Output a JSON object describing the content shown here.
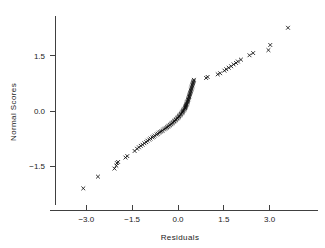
{
  "chart_data": {
    "type": "scatter",
    "title": "",
    "subtitle": "",
    "xlabel": "Residuals",
    "ylabel": "Normal Scores",
    "xlim": [
      -4.0,
      4.4
    ],
    "ylim": [
      -2.6,
      2.7
    ],
    "xticks": [
      -3.0,
      -1.5,
      0.0,
      1.5,
      3.0
    ],
    "xticklabels": [
      "−3.0",
      "−1.5",
      "0.0",
      "1.5",
      "3.0"
    ],
    "yticks": [
      -1.5,
      0.0,
      1.5
    ],
    "yticklabels": [
      "−1.5",
      "0.0",
      "1.5"
    ],
    "grid": false,
    "legend": null,
    "marker": "x",
    "marker_color": "#111111",
    "series": [
      {
        "name": "Residuals vs Normal Scores",
        "points": [
          [
            -3.1,
            -2.11
          ],
          [
            -2.62,
            -1.79
          ],
          [
            -2.08,
            -1.57
          ],
          [
            -2.02,
            -1.49
          ],
          [
            -2.0,
            -1.42
          ],
          [
            -1.96,
            -1.39
          ],
          [
            -1.72,
            -1.27
          ],
          [
            -1.66,
            -1.23
          ],
          [
            -1.42,
            -1.09
          ],
          [
            -1.34,
            -1.03
          ],
          [
            -1.28,
            -0.99
          ],
          [
            -1.22,
            -0.95
          ],
          [
            -1.16,
            -0.92
          ],
          [
            -1.1,
            -0.88
          ],
          [
            -1.04,
            -0.85
          ],
          [
            -1.0,
            -0.81
          ],
          [
            -0.94,
            -0.78
          ],
          [
            -0.9,
            -0.75
          ],
          [
            -0.84,
            -0.72
          ],
          [
            -0.8,
            -0.7
          ],
          [
            -0.76,
            -0.67
          ],
          [
            -0.7,
            -0.64
          ],
          [
            -0.66,
            -0.62
          ],
          [
            -0.62,
            -0.59
          ],
          [
            -0.58,
            -0.57
          ],
          [
            -0.54,
            -0.55
          ],
          [
            -0.5,
            -0.53
          ],
          [
            -0.46,
            -0.5
          ],
          [
            -0.42,
            -0.48
          ],
          [
            -0.38,
            -0.46
          ],
          [
            -0.35,
            -0.44
          ],
          [
            -0.32,
            -0.42
          ],
          [
            -0.29,
            -0.4
          ],
          [
            -0.26,
            -0.38
          ],
          [
            -0.23,
            -0.36
          ],
          [
            -0.2,
            -0.34
          ],
          [
            -0.18,
            -0.32
          ],
          [
            -0.15,
            -0.3
          ],
          [
            -0.12,
            -0.28
          ],
          [
            -0.1,
            -0.26
          ],
          [
            -0.07,
            -0.24
          ],
          [
            -0.05,
            -0.22
          ],
          [
            -0.02,
            -0.2
          ],
          [
            0.0,
            -0.18
          ],
          [
            0.02,
            -0.16
          ],
          [
            0.04,
            -0.14
          ],
          [
            0.06,
            -0.12
          ],
          [
            0.08,
            -0.1
          ],
          [
            0.1,
            -0.08
          ],
          [
            0.12,
            -0.06
          ],
          [
            0.14,
            -0.04
          ],
          [
            0.15,
            -0.02
          ],
          [
            0.17,
            0.0
          ],
          [
            0.18,
            0.02
          ],
          [
            0.2,
            0.04
          ],
          [
            0.21,
            0.06
          ],
          [
            0.23,
            0.08
          ],
          [
            0.24,
            0.1
          ],
          [
            0.25,
            0.12
          ],
          [
            0.26,
            0.14
          ],
          [
            0.27,
            0.16
          ],
          [
            0.28,
            0.18
          ],
          [
            0.29,
            0.2
          ],
          [
            0.3,
            0.23
          ],
          [
            0.31,
            0.25
          ],
          [
            0.32,
            0.27
          ],
          [
            0.33,
            0.3
          ],
          [
            0.34,
            0.32
          ],
          [
            0.35,
            0.35
          ],
          [
            0.36,
            0.38
          ],
          [
            0.37,
            0.4
          ],
          [
            0.38,
            0.43
          ],
          [
            0.39,
            0.46
          ],
          [
            0.4,
            0.49
          ],
          [
            0.41,
            0.52
          ],
          [
            0.42,
            0.55
          ],
          [
            0.43,
            0.58
          ],
          [
            0.44,
            0.61
          ],
          [
            0.45,
            0.64
          ],
          [
            0.46,
            0.67
          ],
          [
            0.47,
            0.7
          ],
          [
            0.48,
            0.73
          ],
          [
            0.49,
            0.76
          ],
          [
            0.5,
            0.79
          ],
          [
            0.51,
            0.82
          ],
          [
            0.52,
            0.85
          ],
          [
            0.92,
            0.9
          ],
          [
            0.97,
            0.93
          ],
          [
            1.3,
            1.0
          ],
          [
            1.38,
            1.03
          ],
          [
            1.52,
            1.1
          ],
          [
            1.58,
            1.14
          ],
          [
            1.66,
            1.18
          ],
          [
            1.74,
            1.22
          ],
          [
            1.82,
            1.27
          ],
          [
            1.9,
            1.31
          ],
          [
            1.96,
            1.35
          ],
          [
            2.06,
            1.4
          ],
          [
            2.34,
            1.52
          ],
          [
            2.46,
            1.58
          ],
          [
            2.96,
            1.66
          ],
          [
            3.02,
            1.8
          ],
          [
            3.6,
            2.27
          ]
        ]
      }
    ]
  },
  "axes": {
    "x_axis_label": "Residuals",
    "y_axis_label": "Normal Scores"
  }
}
